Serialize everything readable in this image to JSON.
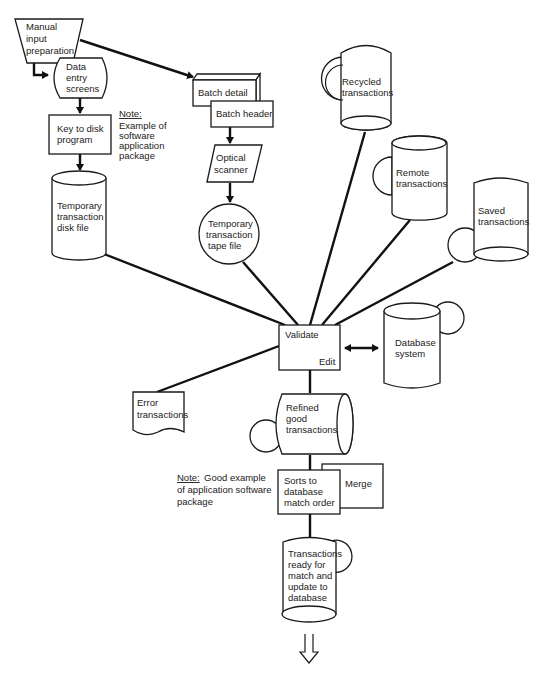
{
  "diagram": {
    "nodes": {
      "manual_input": {
        "lines": [
          "Manual",
          "input",
          "preparation"
        ],
        "shape": "manual-operation-trapezoid"
      },
      "data_entry": {
        "lines": [
          "Data",
          "entry",
          "screens"
        ],
        "shape": "display"
      },
      "key_to_disk": {
        "lines": [
          "Key to disk",
          "program"
        ],
        "shape": "process"
      },
      "note1": {
        "title": "Note:",
        "lines": [
          "Example of",
          "software",
          "application",
          "package"
        ]
      },
      "temp_disk": {
        "lines": [
          "Temporary",
          "transaction",
          "disk file"
        ],
        "shape": "disk-cylinder"
      },
      "batch_detail": {
        "lines": [
          "Batch detail"
        ],
        "shape": "3d-box"
      },
      "batch_header": {
        "lines": [
          "Batch header"
        ],
        "shape": "process"
      },
      "optical_scanner": {
        "lines": [
          "Optical",
          "scanner"
        ],
        "shape": "parallelogram"
      },
      "temp_tape": {
        "lines": [
          "Temporary",
          "transaction",
          "tape file"
        ],
        "shape": "tape-circle"
      },
      "recycled": {
        "lines": [
          "Recycled",
          "transactions"
        ],
        "shape": "storage-with-tape"
      },
      "remote": {
        "lines": [
          "Remote",
          "transactions"
        ],
        "shape": "storage-with-tape"
      },
      "saved": {
        "lines": [
          "Saved",
          "transactions"
        ],
        "shape": "storage-with-tape"
      },
      "validate": {
        "label_top": "Validate",
        "label_bottom": "Edit",
        "shape": "process"
      },
      "database": {
        "lines": [
          "Database",
          "system"
        ],
        "shape": "storage-with-tape"
      },
      "error": {
        "lines": [
          "Error",
          "transactions"
        ],
        "shape": "document"
      },
      "refined": {
        "lines": [
          "Refined",
          "good",
          "transactions"
        ],
        "shape": "horizontal-cylinder"
      },
      "note2": {
        "title": "Note:",
        "title_rest": "Good example",
        "lines": [
          "of application software",
          "package"
        ]
      },
      "sorts": {
        "lines": [
          "Sorts to",
          "database",
          "match order"
        ],
        "shape": "process"
      },
      "merge": {
        "lines": [
          "Merge"
        ],
        "shape": "process"
      },
      "ready": {
        "lines": [
          "Transactions",
          "ready for",
          "match and",
          "update to",
          "database"
        ],
        "shape": "storage-with-tape"
      }
    },
    "edges": [
      [
        "manual_input",
        "data_entry"
      ],
      [
        "manual_input",
        "batch_detail"
      ],
      [
        "data_entry",
        "key_to_disk"
      ],
      [
        "key_to_disk",
        "temp_disk"
      ],
      [
        "batch_header",
        "optical_scanner"
      ],
      [
        "optical_scanner",
        "temp_tape"
      ],
      [
        "temp_disk",
        "validate"
      ],
      [
        "temp_tape",
        "validate"
      ],
      [
        "recycled",
        "validate"
      ],
      [
        "remote",
        "validate"
      ],
      [
        "saved",
        "validate"
      ],
      [
        "validate",
        "database",
        "bidirectional"
      ],
      [
        "validate",
        "error"
      ],
      [
        "validate",
        "refined"
      ],
      [
        "refined",
        "sorts"
      ],
      [
        "sorts",
        "ready"
      ],
      [
        "ready",
        "continues-down"
      ]
    ],
    "colors": {
      "line": "#111111",
      "background": "#ffffff"
    }
  }
}
